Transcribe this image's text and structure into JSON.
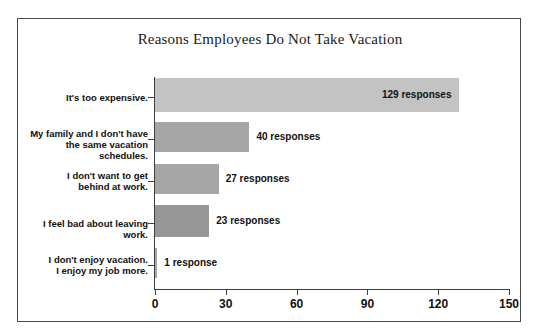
{
  "clipped_top_text": "",
  "chart_frame": {
    "border_color": "#4a4a4a",
    "background": "#ffffff"
  },
  "chart_data": {
    "type": "bar",
    "orientation": "horizontal",
    "title": "Reasons Employees Do Not Take Vacation",
    "xlabel": "",
    "ylabel": "",
    "xlim": [
      0,
      150
    ],
    "xticks": [
      0,
      30,
      60,
      90,
      120,
      150
    ],
    "grid": false,
    "legend": null,
    "categories": [
      "It's too expensive.",
      "My family and I don't have\nthe same vacation schedules.",
      "I don't want to get\nbehind at work.",
      "I feel bad about leaving work.",
      "I don't enjoy vacation.\nI enjoy my job more."
    ],
    "values": [
      129,
      40,
      27,
      23,
      1
    ],
    "data_labels": [
      "129 responses",
      "40 responses",
      "27 responses",
      "23 responses",
      "1 response"
    ],
    "bar_colors": [
      "#c3c3c3",
      "#a6a6a6",
      "#a6a6a6",
      "#979797",
      "#a6a6a6"
    ],
    "label_placement": [
      "inside",
      "outside",
      "outside",
      "outside",
      "outside"
    ]
  }
}
